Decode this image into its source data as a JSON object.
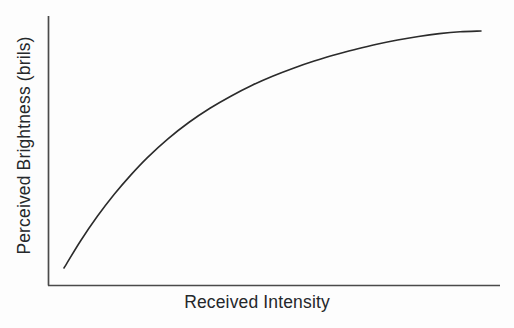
{
  "figure": {
    "background_color": "#fdfdfd",
    "line_color": "#2b2b2b",
    "axis_color": "#4a4a4a",
    "text_color": "#25282b"
  },
  "chart_data": {
    "type": "line",
    "title": "",
    "subtitle": "",
    "xlabel": "Received Intensity",
    "ylabel": "Perceived Brightness (brils)",
    "grid": false,
    "legend": false,
    "legend_position": "none",
    "xlim": [
      0,
      1
    ],
    "ylim": [
      0,
      1
    ],
    "xticks": [],
    "yticks": [],
    "xticklabels": [],
    "yticklabels": [],
    "annotations": [],
    "series": [
      {
        "name": "Perceived brightness vs received intensity",
        "shape": "logarithmic-saturating",
        "x": [
          0.0,
          0.04,
          0.08,
          0.12,
          0.16,
          0.2,
          0.25,
          0.3,
          0.35,
          0.4,
          0.45,
          0.5,
          0.55,
          0.6,
          0.65,
          0.7,
          0.75,
          0.8,
          0.85,
          0.9,
          0.95,
          1.0
        ],
        "y": [
          0.0,
          0.115,
          0.218,
          0.31,
          0.392,
          0.466,
          0.546,
          0.615,
          0.674,
          0.725,
          0.77,
          0.809,
          0.843,
          0.873,
          0.9,
          0.923,
          0.944,
          0.962,
          0.977,
          0.989,
          0.997,
          1.0
        ]
      }
    ]
  },
  "labels": {
    "x_axis": "Received Intensity",
    "y_axis": "Perceived Brightness (brils)"
  }
}
